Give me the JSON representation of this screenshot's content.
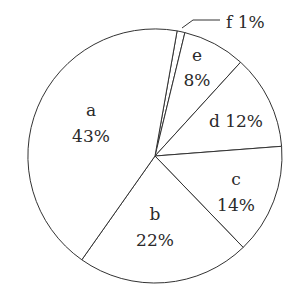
{
  "chart_data": {
    "type": "pie",
    "title": "",
    "categories": [
      "a",
      "b",
      "c",
      "d",
      "e",
      "f"
    ],
    "values": [
      43,
      22,
      14,
      12,
      8,
      1
    ],
    "unit": "%",
    "labels": [
      {
        "name": "a",
        "pct": "43%"
      },
      {
        "name": "b",
        "pct": "22%"
      },
      {
        "name": "c",
        "pct": "14%"
      },
      {
        "name": "d",
        "pct": "12%"
      },
      {
        "name": "e",
        "pct": "8%"
      },
      {
        "name": "f",
        "pct": "1%"
      }
    ],
    "legend": "none",
    "style": {
      "fill": "#ffffff",
      "stroke": "#333333"
    }
  },
  "labels": {
    "a_name": "a",
    "a_pct": "43%",
    "b_name": "b",
    "b_pct": "22%",
    "c_name": "c",
    "c_pct": "14%",
    "d_full": "d 12%",
    "e_name": "e",
    "e_pct": "8%",
    "f_full": "f 1%"
  }
}
